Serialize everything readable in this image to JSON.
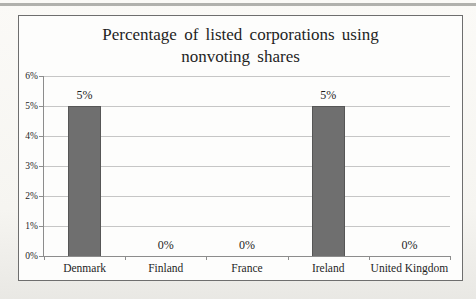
{
  "chart_data": {
    "type": "bar",
    "title": "Percentage of listed corporations using nonvoting shares",
    "categories": [
      "Denmark",
      "Finland",
      "France",
      "Ireland",
      "United Kingdom"
    ],
    "values": [
      5,
      0,
      0,
      5,
      0
    ],
    "data_labels": [
      "5%",
      "0%",
      "0%",
      "5%",
      "0%"
    ],
    "xlabel": "",
    "ylabel": "",
    "ylim": [
      0,
      6
    ],
    "ytick_labels": [
      "0%",
      "1%",
      "2%",
      "3%",
      "4%",
      "5%",
      "6%"
    ],
    "grid": true,
    "legend": false,
    "colors": {
      "bar": "#6f6f6f",
      "bar_border": "#565656",
      "gridline": "#c6c6c6",
      "axis": "#8c8c8c",
      "frame_border": "#6e6e6e",
      "text": "#1f1f1f",
      "scan_edge": "#a5a5a1"
    }
  }
}
